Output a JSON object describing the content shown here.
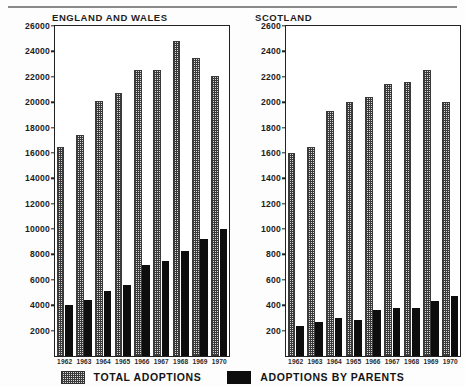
{
  "chart_data": [
    {
      "type": "bar",
      "title": "ENGLAND AND WALES",
      "xlabel": "",
      "ylabel": "",
      "ylim": [
        0,
        26000
      ],
      "ystep": 2000,
      "yticks": [
        0,
        2000,
        4000,
        6000,
        8000,
        10000,
        12000,
        14000,
        16000,
        18000,
        20000,
        22000,
        24000,
        26000
      ],
      "ytick_labels": [
        "",
        "2000",
        "4000",
        "6000",
        "8000",
        "10000",
        "12000",
        "14000",
        "16000",
        "18000",
        "20000",
        "22000",
        "24000",
        "26000"
      ],
      "categories": [
        "1962",
        "1963",
        "1964",
        "1965",
        "1966",
        "1967",
        "1968",
        "1969",
        "1970"
      ],
      "grid": false,
      "legend_position": "bottom",
      "series": [
        {
          "name": "TOTAL ADOPTIONS",
          "key": "total",
          "values": [
            16500,
            17400,
            20100,
            20700,
            22500,
            22500,
            24800,
            23500,
            22100
          ]
        },
        {
          "name": "ADOPTIONS BY PARENTS",
          "key": "parents",
          "values": [
            4000,
            4400,
            5100,
            5600,
            7200,
            7500,
            8300,
            9200,
            10000
          ]
        }
      ]
    },
    {
      "type": "bar",
      "title": "SCOTLAND",
      "xlabel": "",
      "ylabel": "",
      "ylim": [
        0,
        2600
      ],
      "ystep": 200,
      "yticks": [
        0,
        200,
        400,
        600,
        800,
        1000,
        1200,
        1400,
        1600,
        1800,
        2000,
        2200,
        2400,
        2600
      ],
      "ytick_labels": [
        "",
        "200",
        "400",
        "600",
        "800",
        "1000",
        "1200",
        "1400",
        "1600",
        "1800",
        "2000",
        "2200",
        "2400",
        "2600"
      ],
      "categories": [
        "1962",
        "1963",
        "1964",
        "1965",
        "1966",
        "1967",
        "1968",
        "1969",
        "1970"
      ],
      "grid": false,
      "legend_position": "bottom",
      "series": [
        {
          "name": "TOTAL ADOPTIONS",
          "key": "total",
          "values": [
            1600,
            1650,
            1930,
            2000,
            2040,
            2140,
            2160,
            2250,
            2000
          ]
        },
        {
          "name": "ADOPTIONS BY PARENTS",
          "key": "parents",
          "values": [
            240,
            270,
            300,
            280,
            360,
            380,
            380,
            430,
            470
          ]
        }
      ]
    }
  ],
  "legend": {
    "total_label": "TOTAL ADOPTIONS",
    "parents_label": "ADOPTIONS BY PARENTS"
  },
  "colors": {
    "total_fill": "#d9d9d9",
    "total_pattern": "#3a3a3a",
    "parents_fill": "#0d0d0d",
    "axis": "#222222",
    "text": "#1a1a1a",
    "background": "#fdfdfd",
    "rule": "#8a8a8a"
  }
}
